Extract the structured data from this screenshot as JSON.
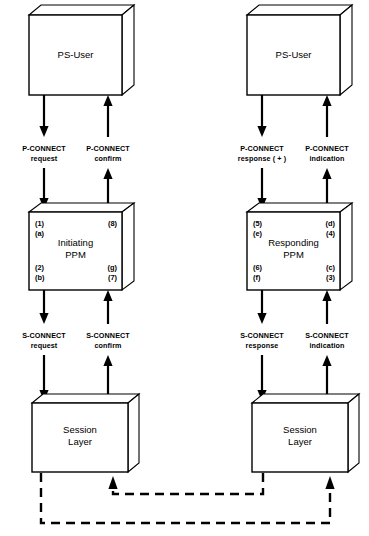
{
  "diagram": {
    "colors": {
      "stroke": "#000000",
      "background": "#ffffff",
      "fill": "#ffffff"
    },
    "columns": [
      {
        "id": "initiating",
        "top_box": {
          "label": "PS-User"
        },
        "middle_box": {
          "label_line1": "Initiating",
          "label_line2": "PPM",
          "tags": {
            "top_left": [
              "(1)",
              "(a)"
            ],
            "top_right": [
              "(8)"
            ],
            "bottom_left": [
              "(2)",
              "(b)"
            ],
            "bottom_right": [
              "(g)",
              "(7)"
            ]
          }
        },
        "bottom_box": {
          "label_line1": "Session",
          "label_line2": "Layer"
        },
        "upper_labels": [
          {
            "line1": "P-CONNECT",
            "line2": "request",
            "direction": "down"
          },
          {
            "line1": "P-CONNECT",
            "line2": "confirm",
            "direction": "up"
          }
        ],
        "lower_labels": [
          {
            "line1": "S-CONNECT",
            "line2": "request",
            "direction": "down"
          },
          {
            "line1": "S-CONNECT",
            "line2": "confirm",
            "direction": "up"
          }
        ]
      },
      {
        "id": "responding",
        "top_box": {
          "label": "PS-User"
        },
        "middle_box": {
          "label_line1": "Responding",
          "label_line2": "PPM",
          "tags": {
            "top_left": [
              "(5)",
              "(e)"
            ],
            "top_right": [
              "(d)",
              "(4)"
            ],
            "bottom_left": [
              "(6)",
              "(f)"
            ],
            "bottom_right": [
              "(c)",
              "(3)"
            ]
          }
        },
        "bottom_box": {
          "label_line1": "Session",
          "label_line2": "Layer"
        },
        "upper_labels": [
          {
            "line1": "P-CONNECT",
            "line2": "response ( + )",
            "direction": "down"
          },
          {
            "line1": "P-CONNECT",
            "line2": "indication",
            "direction": "up"
          }
        ],
        "lower_labels": [
          {
            "line1": "S-CONNECT",
            "line2": "response",
            "direction": "down"
          },
          {
            "line1": "S-CONNECT",
            "line2": "indication",
            "direction": "up"
          }
        ]
      }
    ],
    "peer_links": [
      {
        "id": "forward-peer-link",
        "style": "dashed",
        "from": "left-session-layer",
        "to": "right-session-layer"
      },
      {
        "id": "reverse-peer-link",
        "style": "dashed",
        "from": "right-session-layer",
        "to": "left-session-layer"
      }
    ]
  }
}
